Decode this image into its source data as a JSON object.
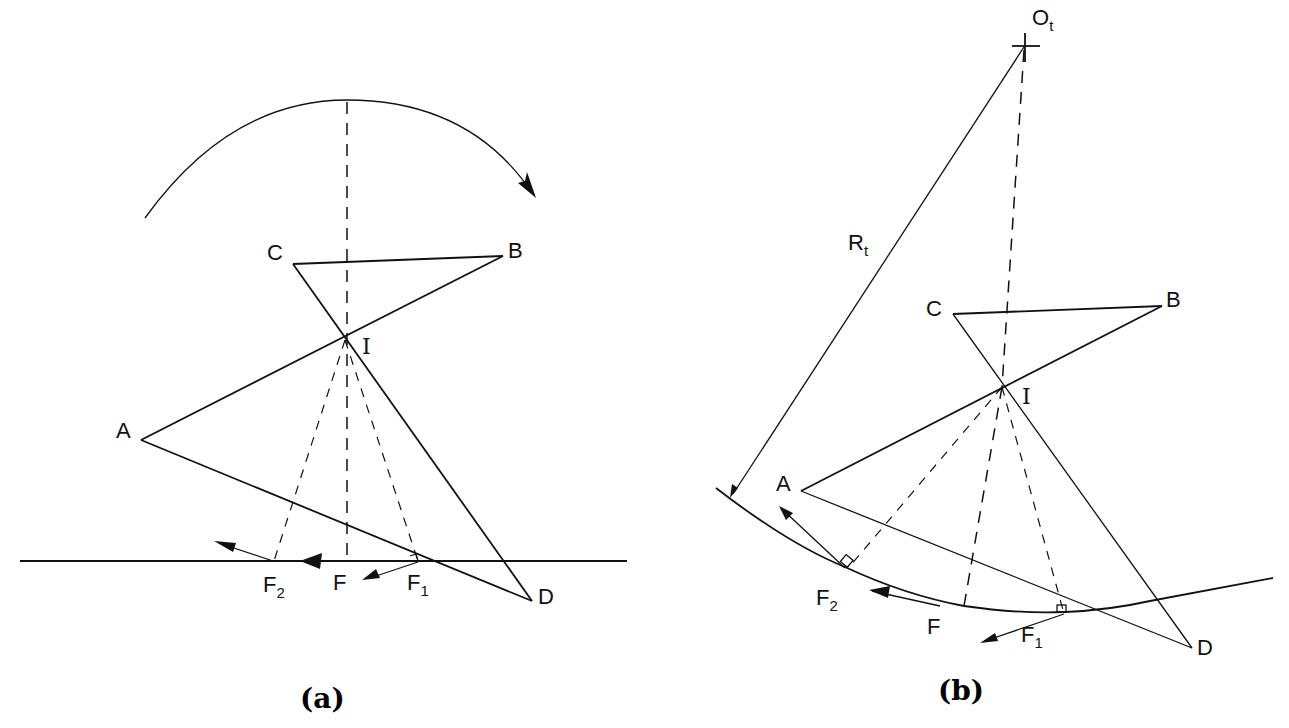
{
  "figure": {
    "panels": [
      {
        "id": "a",
        "caption": "(a)",
        "ground": "flat",
        "points": {
          "A": "A",
          "B": "B",
          "C": "C",
          "D": "D",
          "I": "I"
        },
        "forces": {
          "F": "F",
          "F1": "F",
          "F1_sub": "1",
          "F2": "F",
          "F2_sub": "2"
        },
        "rotation_arrow": "clockwise"
      },
      {
        "id": "b",
        "caption": "(b)",
        "ground": "curved",
        "points": {
          "A": "A",
          "B": "B",
          "C": "C",
          "D": "D",
          "I": "I",
          "Ot": "O",
          "Ot_sub": "t"
        },
        "radius": {
          "label": "R",
          "sub": "t"
        },
        "forces": {
          "F": "F",
          "F1": "F",
          "F1_sub": "1",
          "F2": "F",
          "F2_sub": "2"
        }
      }
    ],
    "colors": {
      "ink": "#111111",
      "background": "#ffffff"
    }
  }
}
